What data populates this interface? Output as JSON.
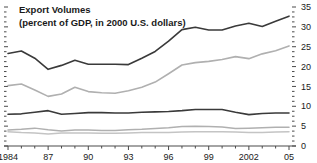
{
  "chart_data": {
    "type": "line",
    "title": "Export Volumes",
    "subtitle": "(percent of GDP, in 2000 U.S. dollars)",
    "xlabel": "",
    "ylabel": "",
    "ylim": [
      0,
      35
    ],
    "xlim": [
      1984,
      2005
    ],
    "grid": false,
    "legend": "none",
    "ytick_labels": [
      "0",
      "5",
      "10",
      "15",
      "20",
      "25",
      "30",
      "35"
    ],
    "ytick_values": [
      0,
      5,
      10,
      15,
      20,
      25,
      30,
      35
    ],
    "yminor_step": 1.25,
    "xtick_labels": [
      "1984",
      "87",
      "90",
      "93",
      "96",
      "99",
      "2002",
      "05"
    ],
    "xtick_values": [
      1984,
      1987,
      1990,
      1993,
      1996,
      1999,
      2002,
      2005
    ],
    "x": [
      1984,
      1985,
      1986,
      1987,
      1988,
      1989,
      1990,
      1991,
      1992,
      1993,
      1994,
      1995,
      1996,
      1997,
      1998,
      1999,
      2000,
      2001,
      2002,
      2003,
      2004,
      2005
    ],
    "series": [
      {
        "name": "series-1-dark-top",
        "color": "#3a3a3a",
        "width": 1.6,
        "values": [
          23.3,
          23.9,
          22.1,
          19.3,
          20.3,
          21.6,
          20.6,
          20.6,
          20.6,
          20.5,
          22.1,
          23.8,
          26.4,
          29.3,
          29.9,
          29.2,
          29.2,
          30.2,
          30.9,
          30.1,
          31.4,
          32.7
        ]
      },
      {
        "name": "series-2-light-upper",
        "color": "#b0b0b0",
        "width": 1.6,
        "values": [
          15.2,
          15.6,
          14.1,
          12.5,
          13.1,
          14.8,
          13.7,
          13.4,
          13.3,
          13.9,
          14.8,
          16.1,
          18.2,
          20.4,
          21.0,
          21.3,
          21.8,
          22.5,
          22.0,
          23.2,
          24.0,
          25.2
        ]
      },
      {
        "name": "series-3-dark-lower",
        "color": "#3a3a3a",
        "width": 1.6,
        "values": [
          8.0,
          8.1,
          8.5,
          8.9,
          8.0,
          8.2,
          8.4,
          8.4,
          8.3,
          8.3,
          8.5,
          8.6,
          8.7,
          8.9,
          9.2,
          9.2,
          9.2,
          8.5,
          7.9,
          8.2,
          8.3,
          8.3
        ]
      },
      {
        "name": "series-4-light-mid",
        "color": "#b0b0b0",
        "width": 1.5,
        "values": [
          4.0,
          4.2,
          4.5,
          4.1,
          3.8,
          4.0,
          4.0,
          3.9,
          3.9,
          4.1,
          4.2,
          4.4,
          4.6,
          4.9,
          5.0,
          4.9,
          4.8,
          4.4,
          4.5,
          4.6,
          4.7,
          4.7
        ]
      },
      {
        "name": "series-5-light-bottom",
        "color": "#c4c4c4",
        "width": 1.5,
        "values": [
          3.6,
          3.4,
          3.3,
          3.0,
          3.3,
          3.3,
          3.3,
          3.2,
          3.2,
          3.3,
          3.4,
          3.4,
          3.4,
          3.5,
          3.6,
          3.6,
          3.6,
          3.5,
          3.4,
          3.4,
          3.5,
          3.6
        ]
      }
    ]
  },
  "colors": {
    "axis": "#4a4a4a",
    "text": "#1a1a1a",
    "background": "#ffffff"
  }
}
